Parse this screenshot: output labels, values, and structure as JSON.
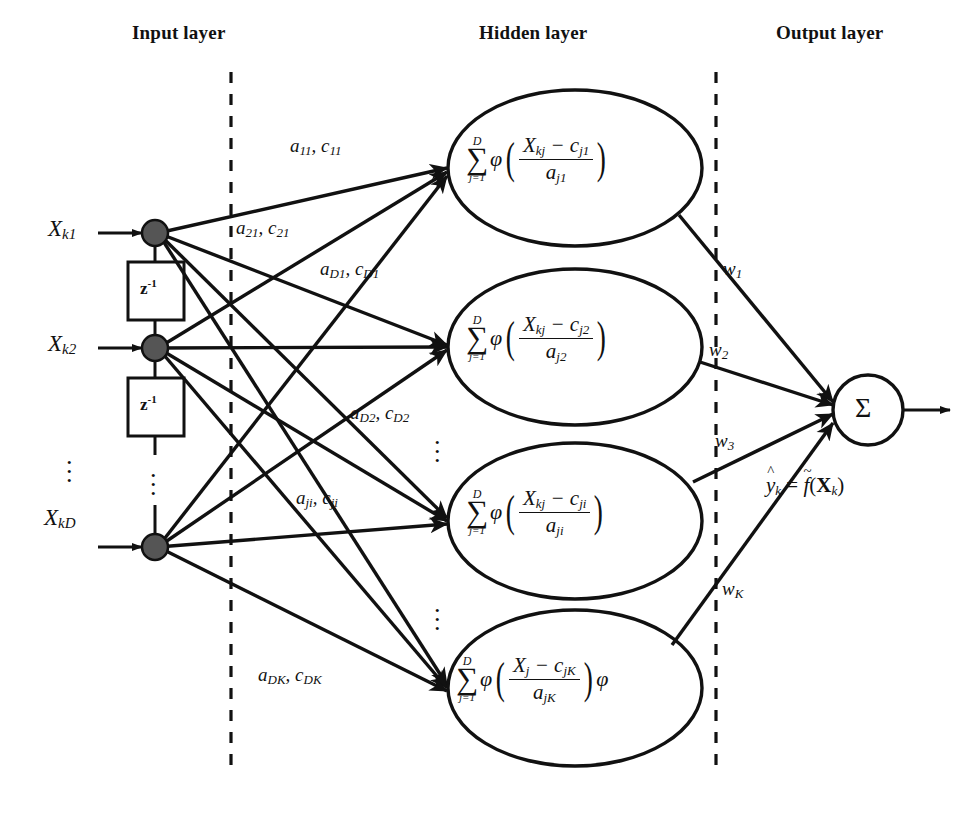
{
  "diagram": {
    "layers": [
      {
        "id": "input",
        "label": "Input layer"
      },
      {
        "id": "hidden",
        "label": "Hidden layer"
      },
      {
        "id": "output",
        "label": "Output layer"
      }
    ],
    "input_nodes": [
      {
        "label_base": "X",
        "label_sub": "k1"
      },
      {
        "label_base": "X",
        "label_sub": "k2"
      },
      {
        "label_base": "X",
        "label_sub": "kD"
      }
    ],
    "delay_blocks": [
      {
        "base": "z",
        "exponent": "-1"
      },
      {
        "base": "z",
        "exponent": "-1"
      }
    ],
    "input_edge_labels": [
      {
        "a": "a",
        "a_sub": "11",
        "c": "c",
        "c_sub": "11",
        "text": "a11, c11"
      },
      {
        "a": "a",
        "a_sub": "21",
        "c": "c",
        "c_sub": "21",
        "text": "a21, c21"
      },
      {
        "a": "a",
        "a_sub": "D1",
        "c": "c",
        "c_sub": "D1",
        "text": "aD1, cD1"
      },
      {
        "a": "a",
        "a_sub": "D2",
        "c": "c",
        "c_sub": "D2",
        "text": "aD2, cD2"
      },
      {
        "a": "a",
        "a_sub": "ji",
        "c": "c",
        "c_sub": "ji",
        "text": "aji, cji"
      },
      {
        "a": "a",
        "a_sub": "DK",
        "c": "c",
        "c_sub": "DK",
        "text": "aDK, cDK"
      }
    ],
    "hidden_nodes": [
      {
        "sum_upper": "D",
        "sum_lower": "j=1",
        "phi": "φ",
        "num_x": "X",
        "num_x_sub": "kj",
        "num_c": "c",
        "num_c_sub": "j1",
        "den_a": "a",
        "den_a_sub": "j1",
        "trailing_phi": ""
      },
      {
        "sum_upper": "D",
        "sum_lower": "j=1",
        "phi": "φ",
        "num_x": "X",
        "num_x_sub": "kj",
        "num_c": "c",
        "num_c_sub": "j2",
        "den_a": "a",
        "den_a_sub": "j2",
        "trailing_phi": ""
      },
      {
        "sum_upper": "D",
        "sum_lower": "j=1",
        "phi": "φ",
        "num_x": "X",
        "num_x_sub": "kj",
        "num_c": "c",
        "num_c_sub": "ji",
        "den_a": "a",
        "den_a_sub": "ji",
        "trailing_phi": ""
      },
      {
        "sum_upper": "D",
        "sum_lower": "j=1",
        "phi": "φ",
        "num_x": "X",
        "num_x_sub": "j",
        "num_c": "c",
        "num_c_sub": "jK",
        "den_a": "a",
        "den_a_sub": "jK",
        "trailing_phi": "φ"
      }
    ],
    "output_weights": [
      {
        "w": "w",
        "sub": "1"
      },
      {
        "w": "w",
        "sub": "2"
      },
      {
        "w": "w",
        "sub": "3"
      },
      {
        "w": "w",
        "sub": "K"
      }
    ],
    "output_node": {
      "symbol": "Σ"
    },
    "output_expression": {
      "y": "y",
      "y_sub": "k",
      "eq": "=",
      "f": "f",
      "open": "(",
      "x": "X",
      "x_sub": "k",
      "close": ")",
      "text": "y_k = f(X_k)"
    },
    "ellipsis": [
      {
        "id": "input-vertical-dots"
      },
      {
        "id": "input-lower-dots"
      },
      {
        "id": "hidden-dots-1"
      },
      {
        "id": "hidden-dots-2"
      },
      {
        "id": "edge-label-dots"
      }
    ],
    "colors": {
      "stroke": "#111111",
      "node_fill": "#555555",
      "background": "#ffffff",
      "divider": "#111111"
    }
  }
}
